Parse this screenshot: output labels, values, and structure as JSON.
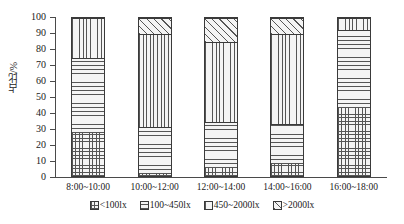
{
  "chart_data": {
    "type": "bar",
    "subtype": "stacked-100-percent",
    "title": "",
    "xlabel": "",
    "ylabel": "占比/%",
    "ylim": [
      0,
      100
    ],
    "ytick_step": 10,
    "yticks": [
      0,
      10,
      20,
      30,
      40,
      50,
      60,
      70,
      80,
      90,
      100
    ],
    "grid": false,
    "legend_position": "bottom",
    "categories": [
      "8:00~10:00",
      "10:00~12:00",
      "12:00~14:00",
      "14:00~16:00",
      "16:00~18:00"
    ],
    "series": [
      {
        "name": "<100lx",
        "pattern": "grid",
        "values": [
          27,
          1.5,
          5,
          7.5,
          43
        ]
      },
      {
        "name": "100~450lx",
        "pattern": "horizontal-lines",
        "values": [
          48,
          29.5,
          29.5,
          25.5,
          49.5
        ]
      },
      {
        "name": "450~2000lx",
        "pattern": "vertical-lines",
        "values": [
          25,
          59,
          50.5,
          57,
          7.5
        ]
      },
      {
        "name": ">2000lx",
        "pattern": "diagonal-lines",
        "values": [
          0,
          10,
          15,
          10,
          0
        ]
      }
    ],
    "cumulative_tops": [
      [
        27,
        75,
        100,
        100
      ],
      [
        1.5,
        31,
        90,
        100
      ],
      [
        5,
        34.5,
        85,
        100
      ],
      [
        7.5,
        33,
        90,
        100
      ],
      [
        43,
        92.5,
        100,
        100
      ]
    ]
  },
  "axis": {
    "y_title": "占比/%",
    "y_tick_labels": [
      "100",
      "90",
      "80",
      "70",
      "60",
      "50",
      "40",
      "30",
      "20",
      "10",
      "0"
    ],
    "x_tick_labels": [
      "8:00~10:00",
      "10:00~12:00",
      "12:00~14:00",
      "14:00~16:00",
      "16:00~18:00"
    ]
  },
  "legend": {
    "items": [
      {
        "label": "<100lx",
        "pattern": "grid"
      },
      {
        "label": "100~450lx",
        "pattern": "horizontal-lines"
      },
      {
        "label": "450~2000lx",
        "pattern": "vertical-lines"
      },
      {
        "label": ">2000lx",
        "pattern": "diagonal-lines"
      }
    ]
  },
  "colors": {
    "axis": "#4a4a4a",
    "hatch": "#555555",
    "fill": "#f4f4f4",
    "text": "#1a1a1a",
    "background": "#ffffff"
  }
}
